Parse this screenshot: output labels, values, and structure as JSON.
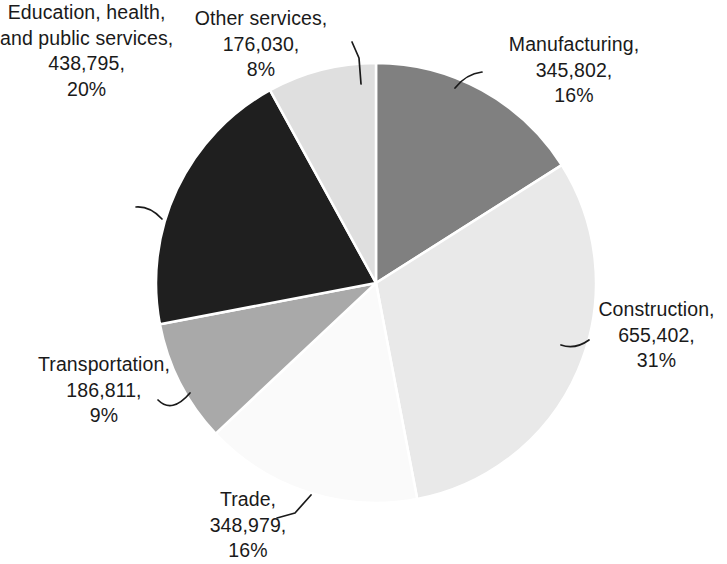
{
  "chart_data": {
    "type": "pie",
    "title": "",
    "subtitle": "",
    "xlabel": "",
    "ylabel": "",
    "legend_position": "none",
    "grid": false,
    "label_format": "name, value, percent",
    "start_angle_deg": 0,
    "direction": "clockwise",
    "total": 2151819,
    "categories": [
      "Manufacturing",
      "Construction",
      "Trade",
      "Transportation",
      "Education, health, and public services",
      "Other services"
    ],
    "values": [
      345802,
      655402,
      348979,
      186811,
      438795,
      176030
    ],
    "percentages": [
      16,
      31,
      16,
      9,
      20,
      8
    ],
    "colors": [
      "#808080",
      "#E9E9E9",
      "#FAFAFA",
      "#A9A9A9",
      "#1F1F1F",
      "#DFDFDF"
    ],
    "slices": [
      {
        "id": "manufacturing",
        "name": "Manufacturing",
        "value": 345802,
        "value_text": "345,802",
        "percent": 16,
        "percent_text": "16%",
        "color": "#808080",
        "label_text": "Manufacturing,\n345,802,\n16%"
      },
      {
        "id": "construction",
        "name": "Construction",
        "value": 655402,
        "value_text": "655,402",
        "percent": 31,
        "percent_text": "31%",
        "color": "#E9E9E9",
        "label_text": "Construction,\n655,402,\n31%"
      },
      {
        "id": "trade",
        "name": "Trade",
        "value": 348979,
        "value_text": "348,979",
        "percent": 16,
        "percent_text": "16%",
        "color": "#FAFAFA",
        "label_text": "Trade,\n348,979,\n16%"
      },
      {
        "id": "transportation",
        "name": "Transportation",
        "value": 186811,
        "value_text": "186,811",
        "percent": 9,
        "percent_text": "9%",
        "color": "#A9A9A9",
        "label_text": "Transportation,\n186,811,\n9%"
      },
      {
        "id": "education-health-public-services",
        "name": "Education, health, and public services",
        "value": 438795,
        "value_text": "438,795",
        "percent": 20,
        "percent_text": "20%",
        "color": "#1F1F1F",
        "label_text": "Education, health,\nand public services,\n438,795,\n20%"
      },
      {
        "id": "other-services",
        "name": "Other services",
        "value": 176030,
        "value_text": "176,030",
        "percent": 8,
        "percent_text": "8%",
        "color": "#DFDFDF",
        "label_text": "Other services,\n176,030,\n8%"
      }
    ]
  },
  "geometry": {
    "center_x": 376,
    "center_y": 283,
    "radius": 220
  }
}
